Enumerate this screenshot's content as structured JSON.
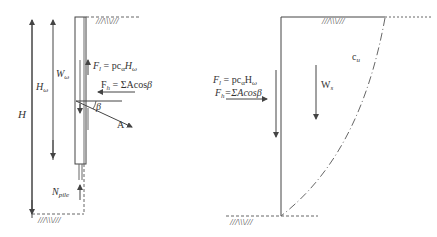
{
  "left_panel": {
    "labels": {
      "H": "H",
      "H_omega": "H",
      "H_omega_sub": "ω",
      "W_omega": "W",
      "W_omega_sub": "ω",
      "F_l_main": "F",
      "F_l_sub": "l",
      "F_l_eq": " = pc",
      "F_l_alpha": "α",
      "F_l_H": "H",
      "F_l_omega": "ω",
      "F_h_main": "F",
      "F_h_sub": "h",
      "F_h_eq": " = ΣAcos",
      "F_h_beta": "β",
      "beta": "β",
      "A": "A",
      "N_pile_main": "N",
      "N_pile_sub": "pile"
    }
  },
  "right_panel": {
    "labels": {
      "F_l_main": "F",
      "F_l_sub": "l",
      "F_l_eq": " = pc",
      "F_l_alpha": "α",
      "F_l_H": "H",
      "F_l_omega": "ω",
      "F_h_main": "F",
      "F_h_sub": "h",
      "F_h_eq": "=ΣAcos",
      "F_h_beta": "β",
      "W_s_main": "W",
      "W_s_sub": "s",
      "c_u_main": "c",
      "c_u_sub": "u"
    }
  },
  "ground_hatch": "///\\\\\\///",
  "colors": {
    "line": "#444444",
    "dash": "#666666"
  }
}
